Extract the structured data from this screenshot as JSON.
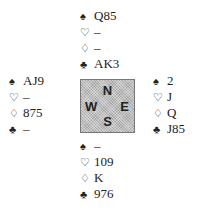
{
  "suit_symbols": {
    "spades": "♠",
    "hearts": "♡",
    "diamonds": "♢",
    "clubs": "♣"
  },
  "hands": {
    "north": {
      "spades": "Q85",
      "hearts": "–",
      "diamonds": "–",
      "clubs": "AK3"
    },
    "west": {
      "spades": "AJ9",
      "hearts": "–",
      "diamonds": "875",
      "clubs": "–"
    },
    "east": {
      "spades": "2",
      "hearts": "J",
      "diamonds": "Q",
      "clubs": "J85"
    },
    "south": {
      "spades": "–",
      "hearts": "109",
      "diamonds": "K",
      "clubs": "976"
    }
  },
  "compass": {
    "n": "N",
    "s": "S",
    "w": "W",
    "e": "E"
  }
}
